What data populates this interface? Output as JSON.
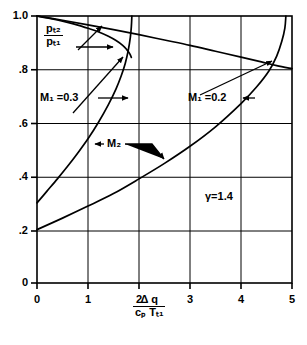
{
  "figure": {
    "background": "#ffffff",
    "ink": "#000000",
    "gamma_note": "γ=1.4"
  },
  "axes": {
    "x": {
      "label_numerator": "Δ q",
      "label_denominator": "cₚ Tₜ₁",
      "ticks": [
        "0",
        "1",
        "2",
        "3",
        "4",
        "5"
      ],
      "min": 0,
      "max": 5
    },
    "y": {
      "label_numerator": "pₜ₂",
      "label_denominator": "pₜ₁",
      "ticks": [
        "1.0",
        ".8",
        ".6",
        ".4",
        ".2",
        "0"
      ],
      "min": 0,
      "max": 1.0
    }
  },
  "annotations": {
    "m1_03": "M₁ =0.3",
    "m1_02": "M₁ =0.2",
    "m2": "M₂",
    "gamma": "γ=1.4"
  },
  "chart_data": {
    "type": "line",
    "title": "",
    "xlabel": "Δq / (c_p T_t1)",
    "ylabel": "p_t2 / p_t1   and   M_2",
    "xlim": [
      0,
      5
    ],
    "ylim": [
      0,
      1.0
    ],
    "grid": true,
    "legend": "inline-annotations",
    "xticks": [
      0,
      1,
      2,
      3,
      4,
      5
    ],
    "yticks": [
      0,
      0.2,
      0.4,
      0.6,
      0.8,
      1.0
    ],
    "annotations": [
      {
        "text": "M₁ =0.3",
        "x": 0.18,
        "y": 0.7
      },
      {
        "text": "M₁ =0.2",
        "x": 2.95,
        "y": 0.7
      },
      {
        "text": "M₂",
        "x": 1.15,
        "y": 0.5
      },
      {
        "text": "γ=1.4",
        "x": 3.3,
        "y": 0.3
      }
    ],
    "series": [
      {
        "name": "p_t2/p_t1, M_1 = 0.3",
        "quantity": "total-pressure-ratio",
        "M1": 0.3,
        "points": [
          [
            0.0,
            1.0
          ],
          [
            0.2,
            0.993
          ],
          [
            0.4,
            0.985
          ],
          [
            0.6,
            0.976
          ],
          [
            0.8,
            0.966
          ],
          [
            1.0,
            0.954
          ],
          [
            1.2,
            0.941
          ],
          [
            1.4,
            0.924
          ],
          [
            1.55,
            0.908
          ],
          [
            1.68,
            0.89
          ],
          [
            1.76,
            0.874
          ],
          [
            1.82,
            0.858
          ],
          [
            1.85,
            0.845
          ]
        ]
      },
      {
        "name": "p_t2/p_t1, M_1 = 0.2",
        "quantity": "total-pressure-ratio",
        "M1": 0.2,
        "points": [
          [
            0.0,
            1.0
          ],
          [
            0.5,
            0.984
          ],
          [
            1.0,
            0.967
          ],
          [
            1.5,
            0.949
          ],
          [
            2.0,
            0.93
          ],
          [
            2.5,
            0.91
          ],
          [
            3.0,
            0.89
          ],
          [
            3.5,
            0.868
          ],
          [
            4.0,
            0.846
          ],
          [
            4.4,
            0.828
          ],
          [
            4.7,
            0.814
          ],
          [
            5.0,
            0.803
          ]
        ]
      },
      {
        "name": "M_2, M_1 = 0.3",
        "quantity": "exit-mach-number",
        "M1": 0.3,
        "points": [
          [
            0.0,
            0.3
          ],
          [
            0.2,
            0.345
          ],
          [
            0.4,
            0.39
          ],
          [
            0.6,
            0.437
          ],
          [
            0.8,
            0.487
          ],
          [
            1.0,
            0.54
          ],
          [
            1.2,
            0.6
          ],
          [
            1.4,
            0.668
          ],
          [
            1.55,
            0.727
          ],
          [
            1.65,
            0.775
          ],
          [
            1.73,
            0.822
          ],
          [
            1.79,
            0.872
          ],
          [
            1.83,
            0.92
          ],
          [
            1.85,
            0.96
          ],
          [
            1.86,
            1.0
          ]
        ]
      },
      {
        "name": "M_2, M_1 = 0.2",
        "quantity": "exit-mach-number",
        "M1": 0.2,
        "points": [
          [
            0.0,
            0.2
          ],
          [
            0.5,
            0.243
          ],
          [
            1.0,
            0.288
          ],
          [
            1.5,
            0.335
          ],
          [
            2.0,
            0.39
          ],
          [
            2.5,
            0.448
          ],
          [
            3.0,
            0.512
          ],
          [
            3.5,
            0.585
          ],
          [
            4.0,
            0.672
          ],
          [
            4.3,
            0.733
          ],
          [
            4.55,
            0.795
          ],
          [
            4.7,
            0.85
          ],
          [
            4.8,
            0.905
          ],
          [
            4.86,
            0.955
          ],
          [
            4.88,
            1.0
          ]
        ]
      }
    ]
  }
}
